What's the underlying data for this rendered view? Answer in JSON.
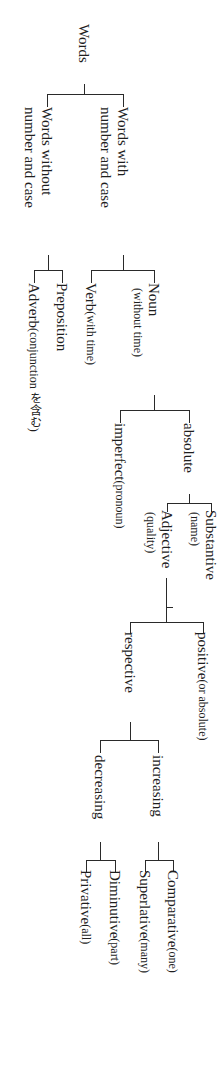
{
  "diagram": {
    "type": "tree",
    "orientation": "rotated-90-clockwise",
    "root": {
      "label": "Words",
      "children": [
        {
          "label": "Words with number and case",
          "line1": "Words with",
          "line2": "number and case",
          "children": [
            {
              "label": "Noun",
              "note": "(without time)",
              "children": [
                {
                  "label": "absolute",
                  "children": [
                    {
                      "label": "Substantive",
                      "note": "(name)"
                    },
                    {
                      "label": "Adjective",
                      "note": "(quality)",
                      "children": [
                        {
                          "label": "positive",
                          "note": "(or absolute)"
                        },
                        {
                          "label": "respective",
                          "children": [
                            {
                              "label": "increasing",
                              "children": [
                                {
                                  "label": "Comparative",
                                  "note": "(one)"
                                },
                                {
                                  "label": "Superlative",
                                  "note": "(many)"
                                }
                              ]
                            },
                            {
                              "label": "decreasing",
                              "children": [
                                {
                                  "label": "Diminutive",
                                  "note": "(part)"
                                },
                                {
                                  "label": "Privative",
                                  "note": "(all)"
                                }
                              ]
                            }
                          ]
                        }
                      ]
                    }
                  ]
                },
                {
                  "label": "imperfect",
                  "note": "(pronoun)"
                }
              ]
            },
            {
              "label": "Verb",
              "note": "(with time)"
            }
          ]
        },
        {
          "label": "Words without number and case",
          "line1": "Words without",
          "line2": "number and case",
          "children": [
            {
              "label": "Preposition"
            },
            {
              "label": "Adverb",
              "note": "(conjunction を含む)"
            }
          ]
        }
      ]
    }
  },
  "labels": {
    "words": "Words",
    "with_l1": "Words with",
    "with_l2": "number and case",
    "without_l1": "Words without",
    "without_l2": "number and case",
    "noun": "Noun",
    "noun_note": "(without time)",
    "verb": "Verb",
    "verb_note": "(with time)",
    "preposition": "Preposition",
    "adverb": "Adverb",
    "adverb_note": "(conjunction を含む)",
    "absolute": "absolute",
    "imperfect": "imperfect",
    "imperfect_note": "(pronoun)",
    "substantive": "Substantive",
    "substantive_note": "(name)",
    "adjective": "Adjective",
    "adjective_note": "(quality)",
    "positive": "positive",
    "positive_note": "(or absolute)",
    "respective": "respective",
    "increasing": "increasing",
    "decreasing": "decreasing",
    "comparative": "Comparative",
    "comparative_note": "(one)",
    "superlative": "Superlative",
    "superlative_note": "(many)",
    "diminutive": "Diminutive",
    "diminutive_note": "(part)",
    "privative": "Privative",
    "privative_note": "(all)"
  },
  "colors": {
    "line": "#2a2a2a",
    "text": "#1e1e1e",
    "background": "#ffffff"
  }
}
